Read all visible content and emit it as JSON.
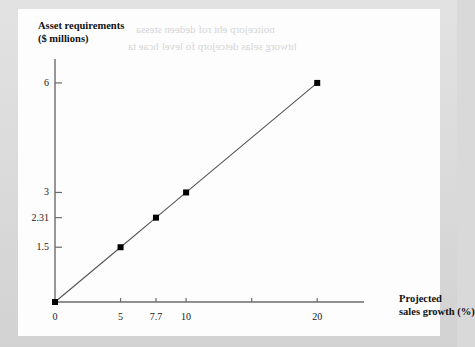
{
  "figure": {
    "background_color": "#d9d9d9",
    "card_color": "#fdfdfd",
    "line_color": "#555555",
    "marker_color": "#000000",
    "axis_color": "#6b6b6b",
    "text_color": "#111111"
  },
  "ghost_text": [
    "noitcejorp eht rof dedeen stessa",
    "htworg selas detcejorp fo level hcae ta"
  ],
  "chart_data": {
    "type": "line",
    "title": "",
    "ylabel": "Asset requirements\n($ millions)",
    "ylabel_line1": "Asset requirements",
    "ylabel_line2": "($ millions)",
    "xlabel": "Projected\nsales growth (%)",
    "xlabel_line1": "Projected",
    "xlabel_line2": "sales growth (%)",
    "x": [
      0,
      5,
      7.7,
      10,
      20
    ],
    "y": [
      0,
      1.5,
      2.31,
      3,
      6
    ],
    "series": [
      {
        "name": "Asset requirements",
        "points": [
          {
            "x": 0,
            "y": 0.0
          },
          {
            "x": 5,
            "y": 1.5
          },
          {
            "x": 7.7,
            "y": 2.31
          },
          {
            "x": 10,
            "y": 3.0
          },
          {
            "x": 20,
            "y": 6.0
          }
        ]
      }
    ],
    "slope": 0.3,
    "xlim": [
      0,
      22.5
    ],
    "ylim": [
      0,
      6.6
    ],
    "grid": false,
    "legend": false,
    "legend_position": "none",
    "xticks": [
      {
        "value": 0,
        "label": "0"
      },
      {
        "value": 5,
        "label": "5"
      },
      {
        "value": 7.7,
        "label": "7.7"
      },
      {
        "value": 10,
        "label": "10"
      },
      {
        "value": 15,
        "label": ""
      },
      {
        "value": 20,
        "label": "20"
      }
    ],
    "yticks": [
      {
        "value": 1.5,
        "label": "1.5"
      },
      {
        "value": 2.31,
        "label": "2.31"
      },
      {
        "value": 3,
        "label": "3"
      },
      {
        "value": 6,
        "label": "6"
      }
    ],
    "markers": "filled-square",
    "annotations": []
  }
}
